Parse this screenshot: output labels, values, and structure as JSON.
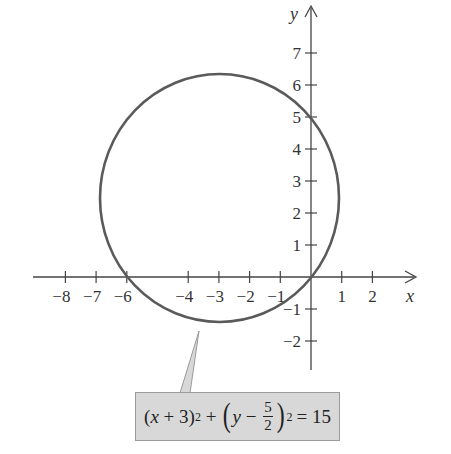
{
  "chart_data": {
    "type": "line",
    "title": "",
    "xlabel": "x",
    "ylabel": "y",
    "x_ticks": [
      -8,
      -7,
      -6,
      -4,
      -3,
      -2,
      -1,
      1,
      2
    ],
    "y_ticks": [
      7,
      6,
      5,
      4,
      3,
      2,
      1,
      -1,
      -2
    ],
    "x_tick_labels": [
      "−8",
      "−7",
      "−6",
      "−4",
      "−3",
      "−2",
      "−1",
      "1",
      "2"
    ],
    "y_tick_labels": [
      "7",
      "6",
      "5",
      "4",
      "3",
      "2",
      "1",
      "−1",
      "−2"
    ],
    "xlim": [
      -9,
      3
    ],
    "ylim": [
      -3,
      8
    ],
    "grid": false,
    "series": [
      {
        "name": "circle",
        "shape": "circle",
        "center": [
          -3,
          2.5
        ],
        "radius": 3.873,
        "radius_squared": 15,
        "color": "#555555"
      }
    ],
    "annotations": [
      {
        "type": "callout",
        "text": "(x + 3)^2 + (y − 5/2)^2 = 15",
        "points_to": [
          -3.4,
          -1.7
        ]
      }
    ]
  },
  "axes": {
    "x_name": "x",
    "y_name": "y"
  },
  "callout": {
    "lhs_open": "(",
    "lhs_var": "x",
    "lhs_op": " + 3)",
    "exp1": "2",
    "plus": " + ",
    "paren_open": "(",
    "rhs_var": "y",
    "minus": " − ",
    "frac_num": "5",
    "frac_den": "2",
    "paren_close": ")",
    "exp2": "2",
    "equals": "= 15"
  },
  "colors": {
    "axis": "#444444",
    "curve": "#555555",
    "callout_bg": "#d8d8d8",
    "callout_border": "#9a9a9a"
  }
}
